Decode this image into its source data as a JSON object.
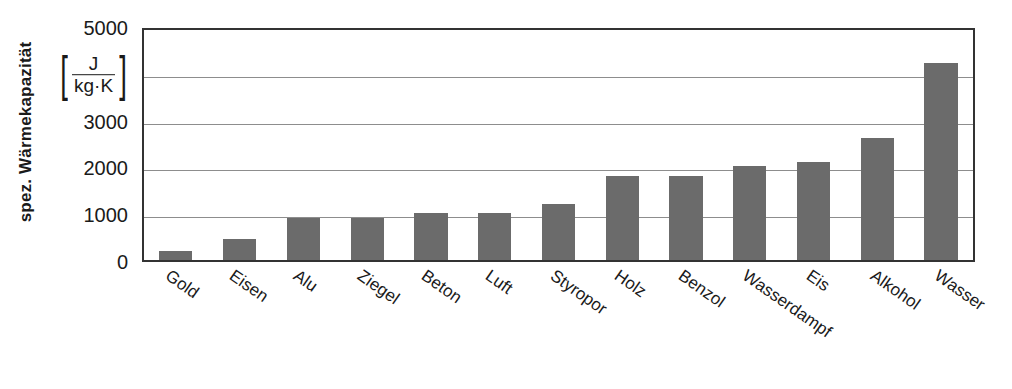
{
  "chart_data": {
    "type": "bar",
    "title": "",
    "xlabel": "",
    "ylabel": "spez. Wärmekapazität",
    "yunit": {
      "numerator": "J",
      "denominator": "kg·K",
      "open_bracket": "[",
      "close_bracket": "]"
    },
    "ylim": [
      0,
      5000
    ],
    "ytick_values": [
      0,
      1000,
      2000,
      3000,
      4000,
      5000
    ],
    "ytick_labels": [
      "0",
      "1000",
      "2000",
      "3000",
      "",
      "5000"
    ],
    "ytick_4000_replaced_by_unit": true,
    "grid": true,
    "legend": "none",
    "bar_color": "#6b6b6b",
    "categories": [
      "Gold",
      "Eisen",
      "Alu",
      "Ziegel",
      "Beton",
      "Luft",
      "Styropor",
      "Holz",
      "Benzol",
      "Wasserdampf",
      "Eis",
      "Alkohol",
      "Wasser"
    ],
    "values": [
      200,
      450,
      900,
      900,
      1000,
      1000,
      1200,
      1800,
      1800,
      2000,
      2100,
      2600,
      4200
    ]
  }
}
